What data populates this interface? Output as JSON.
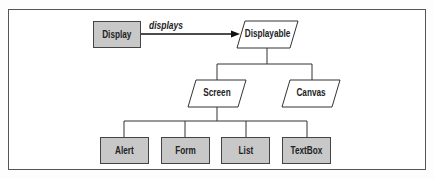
{
  "diagram": {
    "type": "class-hierarchy",
    "nodes": {
      "display": {
        "label": "Display",
        "shape": "rectangle",
        "fill": "#c8c8c8"
      },
      "displayable": {
        "label": "Displayable",
        "shape": "parallelogram",
        "fill": "#ffffff"
      },
      "screen": {
        "label": "Screen",
        "shape": "parallelogram",
        "fill": "#ffffff"
      },
      "canvas": {
        "label": "Canvas",
        "shape": "parallelogram",
        "fill": "#ffffff"
      },
      "alert": {
        "label": "Alert",
        "shape": "rectangle",
        "fill": "#c8c8c8"
      },
      "form": {
        "label": "Form",
        "shape": "rectangle",
        "fill": "#c8c8c8"
      },
      "list": {
        "label": "List",
        "shape": "rectangle",
        "fill": "#c8c8c8"
      },
      "textbox": {
        "label": "TextBox",
        "shape": "rectangle",
        "fill": "#c8c8c8"
      }
    },
    "edges": [
      {
        "from": "Display",
        "to": "Displayable",
        "label": "displays",
        "style": "arrow"
      },
      {
        "from": "Displayable",
        "to": "Screen",
        "style": "tree"
      },
      {
        "from": "Displayable",
        "to": "Canvas",
        "style": "tree"
      },
      {
        "from": "Screen",
        "to": "Alert",
        "style": "tree"
      },
      {
        "from": "Screen",
        "to": "Form",
        "style": "tree"
      },
      {
        "from": "Screen",
        "to": "List",
        "style": "tree"
      },
      {
        "from": "Screen",
        "to": "TextBox",
        "style": "tree"
      }
    ],
    "edge_label": "displays"
  }
}
